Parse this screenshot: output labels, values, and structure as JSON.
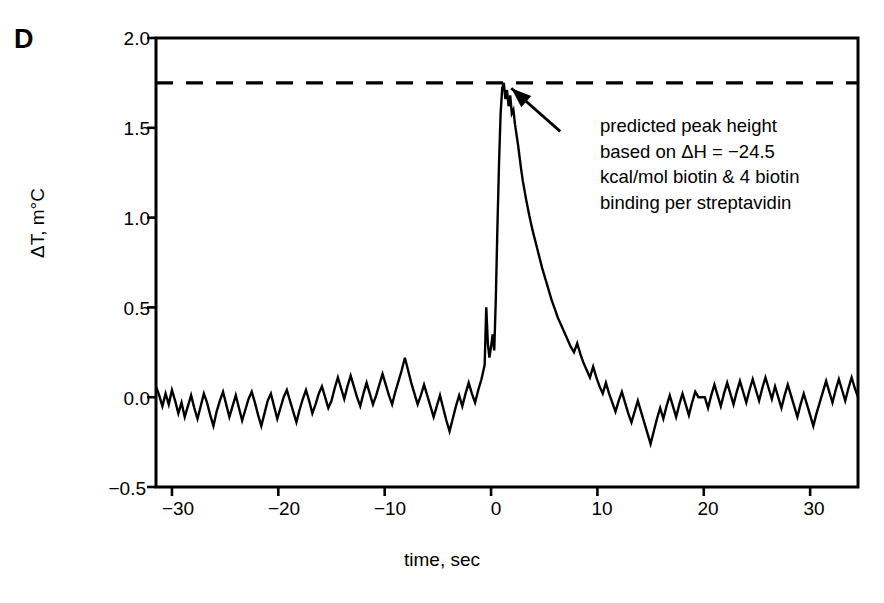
{
  "figure": {
    "panel_label": "D",
    "background_color": "#ffffff",
    "line_color": "#000000"
  },
  "annotation": {
    "lines": [
      "predicted peak height",
      "based on ΔH = −24.5",
      "kcal/mol biotin & 4 biotin",
      "binding per streptavidin"
    ],
    "arrow_name": "annotation-arrow"
  },
  "chart_data": {
    "type": "line",
    "title": "",
    "subtitle": "",
    "xlabel": "time, sec",
    "ylabel": "ΔT, m°C",
    "xlim": [
      -31.5,
      34.5
    ],
    "ylim": [
      -0.5,
      2.0
    ],
    "xticks": [
      -30,
      -20,
      -10,
      0,
      10,
      20,
      30
    ],
    "xtick_labels": [
      "−30",
      "−20",
      "−10",
      "0",
      "10",
      "20",
      "30"
    ],
    "yticks": [
      -0.5,
      0.0,
      0.5,
      1.0,
      1.5,
      2.0
    ],
    "ytick_labels": [
      "−0.5",
      "0.0",
      "0.5",
      "1.0",
      "1.5",
      "2.0"
    ],
    "grid": false,
    "legend": null,
    "legend_position": "none",
    "annotations": [
      {
        "type": "hline",
        "name": "predicted-peak-height-line",
        "y": 1.75,
        "style": "dashed",
        "label": "predicted peak height based on ΔH = −24.5 kcal/mol biotin & 4 biotin binding per streptavidin"
      },
      {
        "type": "arrow",
        "name": "annotation-arrow",
        "from_x": 6.5,
        "from_y": 1.48,
        "to_x": 1.9,
        "to_y": 1.72
      }
    ],
    "series": [
      {
        "name": "temperature trace",
        "color": "#000000",
        "x": [
          -31.5,
          -31.2,
          -30.9,
          -30.6,
          -30.3,
          -30.0,
          -29.7,
          -29.4,
          -29.1,
          -28.8,
          -28.5,
          -28.2,
          -27.9,
          -27.6,
          -27.3,
          -27.0,
          -26.7,
          -26.4,
          -26.1,
          -25.8,
          -25.5,
          -25.2,
          -24.9,
          -24.6,
          -24.3,
          -24.0,
          -23.7,
          -23.4,
          -23.1,
          -22.8,
          -22.5,
          -22.2,
          -21.9,
          -21.6,
          -21.3,
          -21.0,
          -20.7,
          -20.4,
          -20.1,
          -19.8,
          -19.5,
          -19.2,
          -18.9,
          -18.6,
          -18.3,
          -18.0,
          -17.7,
          -17.4,
          -17.1,
          -16.8,
          -16.5,
          -16.2,
          -15.9,
          -15.6,
          -15.3,
          -15.0,
          -14.7,
          -14.4,
          -14.1,
          -13.8,
          -13.5,
          -13.2,
          -12.9,
          -12.6,
          -12.3,
          -12.0,
          -11.7,
          -11.4,
          -11.1,
          -10.8,
          -10.5,
          -10.2,
          -9.9,
          -9.6,
          -9.3,
          -9.0,
          -8.7,
          -8.4,
          -8.1,
          -7.8,
          -7.5,
          -7.2,
          -6.9,
          -6.6,
          -6.3,
          -6.0,
          -5.7,
          -5.4,
          -5.1,
          -4.8,
          -4.5,
          -4.2,
          -3.9,
          -3.6,
          -3.3,
          -3.0,
          -2.7,
          -2.4,
          -2.1,
          -1.8,
          -1.5,
          -1.2,
          -0.9,
          -0.6,
          -0.45,
          -0.3,
          -0.15,
          0.0,
          0.15,
          0.3,
          0.45,
          0.6,
          0.75,
          0.9,
          1.05,
          1.2,
          1.35,
          1.5,
          1.65,
          1.8,
          1.95,
          2.1,
          2.25,
          2.4,
          2.55,
          2.7,
          2.85,
          3.0,
          3.3,
          3.6,
          3.9,
          4.2,
          4.5,
          4.8,
          5.1,
          5.4,
          5.7,
          6.0,
          6.3,
          6.6,
          6.9,
          7.2,
          7.5,
          7.8,
          8.1,
          8.4,
          8.7,
          9.0,
          9.3,
          9.6,
          9.9,
          10.2,
          10.5,
          10.8,
          11.1,
          11.4,
          11.7,
          12.0,
          12.3,
          12.6,
          12.9,
          13.2,
          13.5,
          13.8,
          14.1,
          14.4,
          14.7,
          15.0,
          15.3,
          15.6,
          15.9,
          16.2,
          16.5,
          16.8,
          17.1,
          17.4,
          17.7,
          18.0,
          18.3,
          18.6,
          18.9,
          19.2,
          19.5,
          19.8,
          20.1,
          20.4,
          20.7,
          21.0,
          21.3,
          21.6,
          21.9,
          22.2,
          22.5,
          22.8,
          23.1,
          23.4,
          23.7,
          24.0,
          24.3,
          24.6,
          24.9,
          25.2,
          25.5,
          25.8,
          26.1,
          26.4,
          26.7,
          27.0,
          27.3,
          27.6,
          27.9,
          28.2,
          28.5,
          28.8,
          29.1,
          29.4,
          29.7,
          30.0,
          30.3,
          30.6,
          30.9,
          31.2,
          31.5,
          31.8,
          32.1,
          32.4,
          32.7,
          33.0,
          33.3,
          33.6,
          33.9,
          34.2,
          34.5
        ],
        "y": [
          0.06,
          0.01,
          -0.05,
          0.02,
          -0.04,
          0.04,
          -0.02,
          -0.09,
          -0.03,
          -0.11,
          -0.05,
          0.01,
          -0.06,
          -0.12,
          -0.05,
          0.02,
          -0.03,
          -0.1,
          -0.16,
          -0.08,
          -0.02,
          0.03,
          -0.04,
          -0.11,
          -0.05,
          0.01,
          -0.06,
          -0.13,
          -0.07,
          -0.01,
          0.03,
          -0.03,
          -0.1,
          -0.16,
          -0.09,
          -0.02,
          0.02,
          -0.05,
          -0.12,
          -0.06,
          0.0,
          0.04,
          -0.02,
          -0.08,
          -0.14,
          -0.07,
          -0.01,
          0.04,
          -0.02,
          -0.09,
          -0.04,
          0.02,
          0.06,
          0.0,
          -0.06,
          -0.02,
          0.05,
          0.11,
          0.05,
          -0.01,
          0.06,
          0.12,
          0.06,
          0.0,
          -0.05,
          0.02,
          0.08,
          0.02,
          -0.04,
          0.01,
          0.07,
          0.13,
          0.07,
          0.01,
          -0.04,
          0.03,
          0.09,
          0.15,
          0.22,
          0.15,
          0.08,
          0.02,
          -0.04,
          0.01,
          0.07,
          0.01,
          -0.05,
          -0.11,
          -0.05,
          0.01,
          -0.06,
          -0.13,
          -0.19,
          -0.12,
          -0.05,
          0.01,
          -0.05,
          0.02,
          0.08,
          0.02,
          -0.03,
          0.04,
          0.1,
          0.18,
          0.5,
          0.3,
          0.22,
          0.28,
          0.35,
          0.26,
          0.55,
          0.95,
          1.3,
          1.58,
          1.72,
          1.75,
          1.66,
          1.71,
          1.62,
          1.68,
          1.58,
          1.6,
          1.52,
          1.46,
          1.4,
          1.33,
          1.26,
          1.2,
          1.1,
          1.01,
          0.93,
          0.86,
          0.79,
          0.72,
          0.66,
          0.6,
          0.54,
          0.49,
          0.44,
          0.4,
          0.36,
          0.32,
          0.28,
          0.25,
          0.3,
          0.24,
          0.19,
          0.15,
          0.11,
          0.17,
          0.11,
          0.06,
          0.02,
          0.08,
          0.02,
          -0.03,
          -0.08,
          -0.02,
          0.03,
          -0.03,
          -0.09,
          -0.14,
          -0.08,
          -0.02,
          -0.08,
          -0.14,
          -0.2,
          -0.26,
          -0.19,
          -0.12,
          -0.06,
          -0.12,
          -0.05,
          0.01,
          -0.05,
          -0.11,
          -0.04,
          0.02,
          -0.04,
          -0.1,
          -0.03,
          0.03,
          0.0,
          0.0,
          0.0,
          -0.06,
          0.01,
          0.07,
          0.01,
          -0.05,
          0.02,
          0.08,
          0.02,
          -0.04,
          0.03,
          0.09,
          0.03,
          -0.03,
          0.04,
          0.1,
          0.04,
          -0.02,
          0.05,
          0.11,
          0.05,
          -0.01,
          0.06,
          0.0,
          -0.06,
          0.01,
          0.07,
          0.01,
          -0.05,
          -0.11,
          -0.04,
          0.02,
          -0.04,
          -0.1,
          -0.16,
          -0.09,
          -0.03,
          0.03,
          0.09,
          0.03,
          -0.03,
          0.04,
          0.1,
          0.04,
          -0.02,
          0.05,
          0.11,
          0.05,
          0.0
        ]
      }
    ]
  }
}
